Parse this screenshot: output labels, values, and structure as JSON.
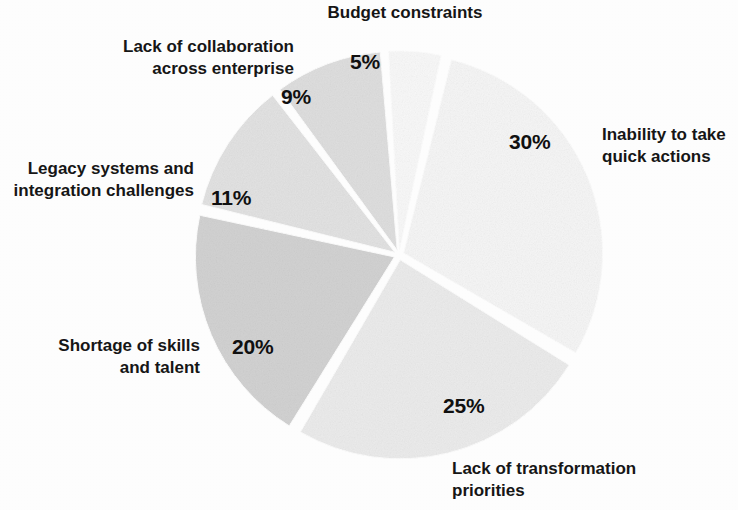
{
  "chart_data": {
    "type": "pie",
    "title": "",
    "subtitle": "",
    "xlabel": "",
    "ylabel": "",
    "legend_position": "outside-labels",
    "grid": false,
    "units": "percent",
    "total": 100,
    "categories": [
      "Inability to take quick actions",
      "Lack of transformation priorities",
      "Shortage of skills and talent",
      "Legacy systems and integration challenges",
      "Lack of collaboration across enterprise",
      "Budget constraints"
    ],
    "values": [
      30,
      25,
      20,
      11,
      9,
      5
    ],
    "value_labels": [
      "30%",
      "25%",
      "20%",
      "11%",
      "9%",
      "5%"
    ],
    "colors": [
      "#f7f7f7",
      "#ededed",
      "#d4d4d4",
      "#e4e4e4",
      "#e0e0e0",
      "#fafafa"
    ],
    "slice_gap_color": "#ffffff",
    "slices": [
      {
        "name": "Inability to take quick actions",
        "value": 30,
        "value_label": "30%",
        "color": "#f7f7f7",
        "start_angle_deg": 13,
        "end_angle_deg": 121
      },
      {
        "name": "Lack of transformation priorities",
        "value": 25,
        "value_label": "25%",
        "color": "#ededed",
        "start_angle_deg": 121,
        "end_angle_deg": 211
      },
      {
        "name": "Shortage of skills and talent",
        "value": 20,
        "value_label": "20%",
        "color": "#d4d4d4",
        "start_angle_deg": 211,
        "end_angle_deg": 283
      },
      {
        "name": "Legacy systems and integration challenges",
        "value": 11,
        "value_label": "11%",
        "color": "#e4e4e4",
        "start_angle_deg": 283,
        "end_angle_deg": 323
      },
      {
        "name": "Lack of collaboration across enterprise",
        "value": 9,
        "value_label": "9%",
        "color": "#e0e0e0",
        "start_angle_deg": 323,
        "end_angle_deg": 356
      },
      {
        "name": "Budget constraints",
        "value": 5,
        "value_label": "5%",
        "color": "#fafafa",
        "start_angle_deg": 356,
        "end_angle_deg": 13
      }
    ]
  },
  "labels": {
    "budget_constraints": "Budget constraints",
    "lack_of_collaboration": "Lack of collaboration\nacross enterprise",
    "legacy_systems": "Legacy systems and\nintegration challenges",
    "shortage_of_skills": "Shortage of skills\nand talent",
    "lack_of_transformation": "Lack of transformation\npriorities",
    "inability_quick_actions": "Inability to take\nquick actions"
  },
  "percents": {
    "budget_constraints": "5%",
    "lack_of_collaboration": "9%",
    "legacy_systems": "11%",
    "shortage_of_skills": "20%",
    "lack_of_transformation": "25%",
    "inability_quick_actions": "30%"
  },
  "geometry": {
    "center_x": 399,
    "center_y": 255,
    "radius": 199
  }
}
